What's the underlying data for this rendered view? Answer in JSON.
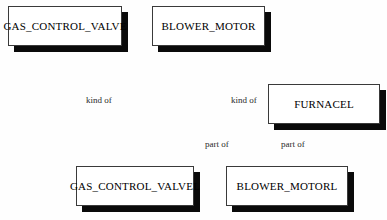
{
  "diagram": {
    "background_color": "#fefefe",
    "box_fill_color": "#ffffff",
    "box_border_color": "#3a3a3a",
    "box_shadow_color": "#0a0a0a",
    "text_color": "#000000",
    "relation_text_color": "#2b2b2b",
    "entities": [
      {
        "id": "gas-control-valve",
        "label": "GAS_CONTROL_VALVE",
        "x": 8,
        "y": 6,
        "width": 114,
        "height": 40
      },
      {
        "id": "blower-motor",
        "label": "BLOWER_MOTOR",
        "x": 152,
        "y": 6,
        "width": 113,
        "height": 40
      },
      {
        "id": "furnacel",
        "label": "FURNACEL",
        "x": 268,
        "y": 84,
        "width": 112,
        "height": 40
      },
      {
        "id": "gas-control-valvel",
        "label": "GAS_CONTROL_VALVEL",
        "x": 76,
        "y": 166,
        "width": 118,
        "height": 40
      },
      {
        "id": "blower-motorl",
        "label": "BLOWER_MOTORL",
        "x": 226,
        "y": 166,
        "width": 122,
        "height": 40
      }
    ],
    "relations": [
      {
        "id": "kind-of-left",
        "label": "kind of",
        "x": 86,
        "y": 95
      },
      {
        "id": "kind-of-right",
        "label": "kind of",
        "x": 231,
        "y": 95
      },
      {
        "id": "part-of-left",
        "label": "part of",
        "x": 205,
        "y": 139
      },
      {
        "id": "part-of-right",
        "label": "part of",
        "x": 281,
        "y": 139
      }
    ]
  }
}
